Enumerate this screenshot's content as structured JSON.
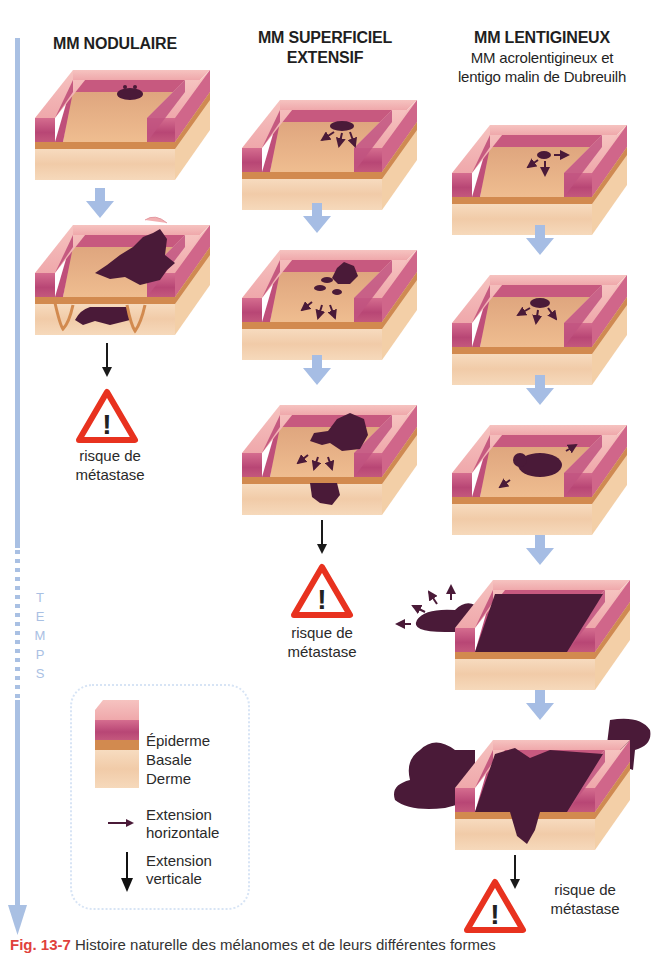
{
  "columns": [
    {
      "title": "MM NODULAIRE",
      "stages": 2,
      "risk_label_line1": "risque de",
      "risk_label_line2": "métastase"
    },
    {
      "title_line1": "MM SUPERFICIEL",
      "title_line2": "EXTENSIF",
      "stages": 3,
      "risk_label_line1": "risque de",
      "risk_label_line2": "métastase"
    },
    {
      "title": "MM LENTIGINEUX",
      "subtitle_line1": "MM acrolentigineux et",
      "subtitle_line2": "lentigo malin de Dubreuilh",
      "stages": 5,
      "risk_label_line1": "risque de",
      "risk_label_line2": "métastase"
    }
  ],
  "timeline": {
    "letters": [
      "T",
      "E",
      "M",
      "P",
      "S"
    ],
    "color": "#a9c0e3"
  },
  "legend": {
    "layers": [
      "Épiderme",
      "Basale",
      "Derme"
    ],
    "horizontal_line1": "Extension",
    "horizontal_line2": "horizontale",
    "vertical_line1": "Extension",
    "vertical_line2": "verticale"
  },
  "caption": {
    "fig_label": "Fig. 13-7",
    "text": "Histoire naturelle des mélanomes et de leurs différentes formes"
  },
  "colors": {
    "epidermis_top": "#f2b6b4",
    "epidermis_side": "#c9577f",
    "basal": "#d8955a",
    "dermis": "#f5d7b6",
    "floor": "#e9b98f",
    "tumor": "#4a1a38",
    "flow_arrow": "#a6bde4",
    "warning_red": "#e8321f"
  }
}
